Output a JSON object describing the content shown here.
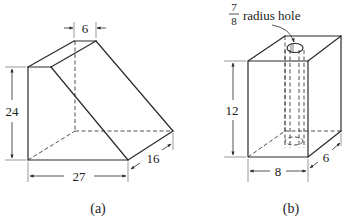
{
  "figure_a": {
    "caption": "(a)",
    "dimensions": {
      "top_width": "6",
      "height": "24",
      "base_length": "27",
      "depth": "16"
    }
  },
  "figure_b": {
    "caption": "(b)",
    "annotation": {
      "fraction_numerator": "7",
      "fraction_denominator": "8",
      "text": "radius hole"
    },
    "dimensions": {
      "height": "12",
      "width": "8",
      "depth": "6"
    }
  },
  "colors": {
    "line": "#2a2a2a",
    "background": "#ffffff"
  }
}
